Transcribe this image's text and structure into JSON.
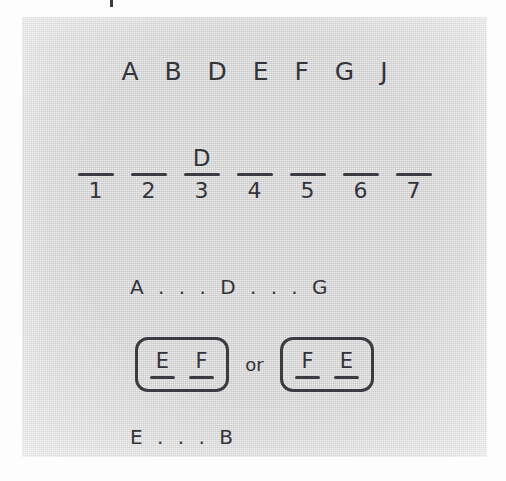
{
  "page": {
    "background_color": "#fdfdfd",
    "card_background_color": "#d6d6d6",
    "ink_color": "#33343a"
  },
  "puzzle": {
    "letter_bank": {
      "label": "A B D E F G J",
      "letters": [
        "A",
        "B",
        "D",
        "E",
        "F",
        "G",
        "J"
      ]
    },
    "blanks": [
      {
        "number": "1",
        "answer": ""
      },
      {
        "number": "2",
        "answer": ""
      },
      {
        "number": "3",
        "answer": "D"
      },
      {
        "number": "4",
        "answer": ""
      },
      {
        "number": "5",
        "answer": ""
      },
      {
        "number": "6",
        "answer": ""
      },
      {
        "number": "7",
        "answer": ""
      }
    ],
    "clues": [
      {
        "id": "clue-order-1",
        "text": "A . . . D . . . G"
      },
      {
        "id": "clue-alternatives",
        "conjunction": "or",
        "options": [
          {
            "letters": [
              "E",
              "F"
            ]
          },
          {
            "letters": [
              "F",
              "E"
            ]
          }
        ]
      },
      {
        "id": "clue-order-2",
        "text": "E . . . B"
      }
    ]
  }
}
